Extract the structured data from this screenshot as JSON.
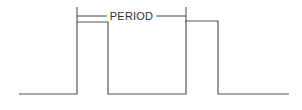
{
  "diagram": {
    "type": "pulse-waveform",
    "background": "#ffffff",
    "line_color": "#555555",
    "dimension": {
      "label": "PERIOD",
      "start_x": 77,
      "end_x": 186,
      "y": 16,
      "tick_top": 7
    },
    "waveform": {
      "baseline_y": 94,
      "high_y": 22,
      "points": [
        [
          19,
          94
        ],
        [
          77,
          94
        ],
        [
          77,
          22
        ],
        [
          108,
          22
        ],
        [
          108,
          94
        ],
        [
          186,
          94
        ],
        [
          186,
          21
        ],
        [
          218,
          21
        ],
        [
          218,
          94
        ],
        [
          289,
          94
        ]
      ]
    }
  }
}
